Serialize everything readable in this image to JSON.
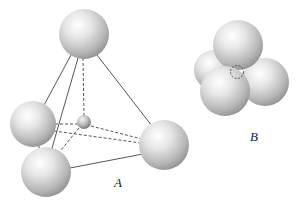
{
  "figure": {
    "panels": [
      {
        "id": "A",
        "label": "A",
        "description": "Tetrahedral arrangement: four large spheres at the vertices of a tetrahedron with a small sphere at the center"
      },
      {
        "id": "B",
        "label": "B",
        "description": "Close-packed view: four large spheres touching with the small tetrahedral hole shown dashed"
      }
    ],
    "colors": {
      "sphere_highlight": "#ffffff",
      "sphere_mid": "#d9d9d9",
      "sphere_shadow": "#8a8a8a",
      "line": "#555555"
    }
  }
}
